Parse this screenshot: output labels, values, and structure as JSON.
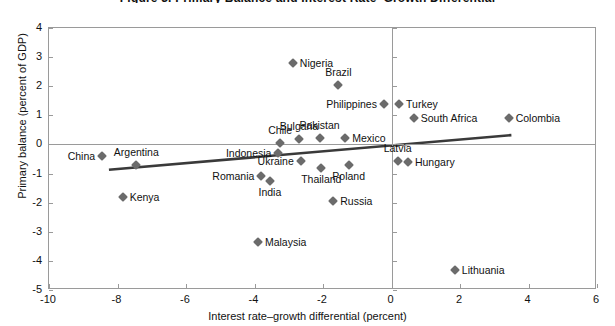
{
  "figure": {
    "cut_title": "Figure 3. Primary Balance and Interest Rate–Growth Differential"
  },
  "chart_data": {
    "type": "scatter",
    "title": "",
    "xlabel": "Interest rate–growth differential (percent)",
    "ylabel": "Primary balance (percent of GDP)",
    "xlim": [
      -10,
      6
    ],
    "ylim": [
      -5,
      4
    ],
    "xticks": [
      "-10",
      "-8",
      "-6",
      "-4",
      "-2",
      "0",
      "2",
      "4",
      "6"
    ],
    "xtick_values": [
      -10,
      -8,
      -6,
      -4,
      -2,
      0,
      2,
      4,
      6
    ],
    "yticks": [
      "4",
      "3",
      "2",
      "1",
      "0",
      "-1",
      "-2",
      "-3",
      "-4",
      "-5"
    ],
    "ytick_values": [
      4,
      3,
      2,
      1,
      0,
      -1,
      -2,
      -3,
      -4,
      -5
    ],
    "grid": false,
    "legend": "none",
    "marker_color": "#6b6b6b",
    "trendline_color": "#3a3a3a",
    "zero_line_color": "#9a9a9a",
    "trendline": {
      "x0": -8.25,
      "y0": -0.87,
      "x1": 3.5,
      "y1": 0.32
    },
    "points": [
      {
        "name": "China",
        "x": -8.45,
        "y": -0.38,
        "label_pos": "l"
      },
      {
        "name": "Argentina",
        "x": -7.45,
        "y": -0.72,
        "label_pos": "a"
      },
      {
        "name": "Kenya",
        "x": -7.85,
        "y": -1.82,
        "label_pos": "r"
      },
      {
        "name": "Nigeria",
        "x": -2.88,
        "y": 2.8,
        "label_pos": "r"
      },
      {
        "name": "Brazil",
        "x": -1.55,
        "y": 2.05,
        "label_pos": "a"
      },
      {
        "name": "Philippines",
        "x": -0.22,
        "y": 1.38,
        "label_pos": "l"
      },
      {
        "name": "Turkey",
        "x": 0.22,
        "y": 1.4,
        "label_pos": "r"
      },
      {
        "name": "South Africa",
        "x": 0.65,
        "y": 0.92,
        "label_pos": "r"
      },
      {
        "name": "Colombia",
        "x": 3.42,
        "y": 0.9,
        "label_pos": "r"
      },
      {
        "name": "Chile",
        "x": -3.25,
        "y": 0.05,
        "label_pos": "a"
      },
      {
        "name": "Bulgaria",
        "x": -2.7,
        "y": 0.2,
        "label_pos": "a"
      },
      {
        "name": "Pakistan",
        "x": -2.1,
        "y": 0.22,
        "label_pos": "a"
      },
      {
        "name": "Mexico",
        "x": -1.35,
        "y": 0.22,
        "label_pos": "r"
      },
      {
        "name": "Indonesia",
        "x": -3.3,
        "y": -0.3,
        "label_pos": "l"
      },
      {
        "name": "Ukraine",
        "x": -2.65,
        "y": -0.58,
        "label_pos": "l"
      },
      {
        "name": "Romania",
        "x": -3.8,
        "y": -1.1,
        "label_pos": "l"
      },
      {
        "name": "India",
        "x": -3.55,
        "y": -1.25,
        "label_pos": "b"
      },
      {
        "name": "Thailand",
        "x": -2.05,
        "y": -0.82,
        "label_pos": "b"
      },
      {
        "name": "Poland",
        "x": -1.25,
        "y": -0.72,
        "label_pos": "b"
      },
      {
        "name": "Latvia",
        "x": 0.18,
        "y": -0.58,
        "label_pos": "a"
      },
      {
        "name": "Hungary",
        "x": 0.48,
        "y": -0.62,
        "label_pos": "r"
      },
      {
        "name": "Russia",
        "x": -1.7,
        "y": -1.95,
        "label_pos": "r"
      },
      {
        "name": "Malaysia",
        "x": -3.9,
        "y": -3.35,
        "label_pos": "r"
      },
      {
        "name": "Lithuania",
        "x": 1.85,
        "y": -4.32,
        "label_pos": "r"
      }
    ]
  }
}
